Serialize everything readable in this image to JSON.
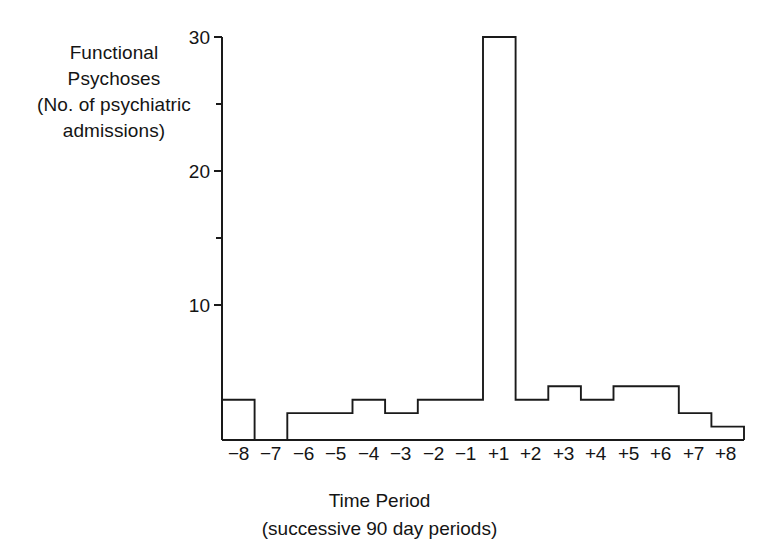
{
  "axes": {
    "y_title_lines": [
      "Functional",
      "Psychoses",
      "(No. of psychiatric",
      "admissions)"
    ],
    "x_title_lines": [
      "Time Period",
      "(successive 90 day periods)"
    ],
    "y_ticks": [
      "10",
      "20",
      "30"
    ],
    "x_ticks": [
      "−8",
      "−7",
      "−6",
      "−5",
      "−4",
      "−3",
      "−2",
      "−1",
      "+1",
      "+2",
      "+3",
      "+4",
      "+5",
      "+6",
      "+7",
      "+8"
    ]
  },
  "colors": {
    "ink": "#1a1a1a",
    "background": "#ffffff"
  },
  "chart_data": {
    "type": "bar",
    "title": "",
    "xlabel": "Time Period (successive 90 day periods)",
    "ylabel": "Functional Psychoses (No. of psychiatric admissions)",
    "categories": [
      "−8",
      "−7",
      "−6",
      "−5",
      "−4",
      "−3",
      "−2",
      "−1",
      "+1",
      "+2",
      "+3",
      "+4",
      "+5",
      "+6",
      "+7",
      "+8"
    ],
    "values": [
      3,
      0,
      2,
      2,
      3,
      2,
      3,
      3,
      30,
      3,
      4,
      3,
      4,
      4,
      2,
      1
    ],
    "ylim": [
      0,
      30
    ],
    "yticks": [
      10,
      20,
      30
    ],
    "grid": false,
    "legend": null,
    "style": "step-outline histogram, unfilled bars, black outline"
  }
}
